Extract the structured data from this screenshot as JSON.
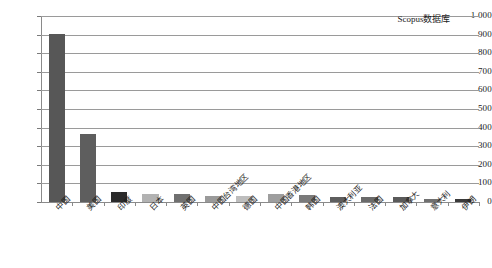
{
  "chart_data": {
    "type": "bar",
    "title": "",
    "subtitle": "",
    "xlabel": "",
    "ylabel": "",
    "ylim": [
      0,
      1000
    ],
    "ytick_step": 100,
    "ytick_labels": [
      "1 000",
      "900",
      "800",
      "700",
      "600",
      "500",
      "400",
      "300",
      "200",
      "100",
      "0"
    ],
    "grid": true,
    "grid_axis": "y",
    "legend": {
      "position": "top-right-inside",
      "entries": [
        "Scopus数据库"
      ]
    },
    "categories": [
      "中国",
      "美国",
      "印度",
      "日本",
      "英国",
      "中国台湾地区",
      "德国",
      "中国香港地区",
      "韩国",
      "澳大利亚",
      "法国",
      "加拿大",
      "意大利",
      "伊朗"
    ],
    "values": [
      905,
      365,
      55,
      45,
      42,
      32,
      30,
      45,
      40,
      28,
      28,
      25,
      18,
      15
    ],
    "bar_colors": [
      "#575757",
      "#5e5e5e",
      "#2b2b2b",
      "#b2b2b2",
      "#707070",
      "#9a9a9a",
      "#bdbdbd",
      "#9e9e9e",
      "#7a7a7a",
      "#5e5e5e",
      "#6a6a6a",
      "#5a5a5a",
      "#707070",
      "#3a3a3a"
    ],
    "series": [
      {
        "name": "Scopus数据库",
        "values": [
          905,
          365,
          55,
          45,
          42,
          32,
          30,
          45,
          40,
          28,
          28,
          25,
          18,
          15
        ]
      }
    ]
  },
  "legend_text": "Scopus数据库"
}
